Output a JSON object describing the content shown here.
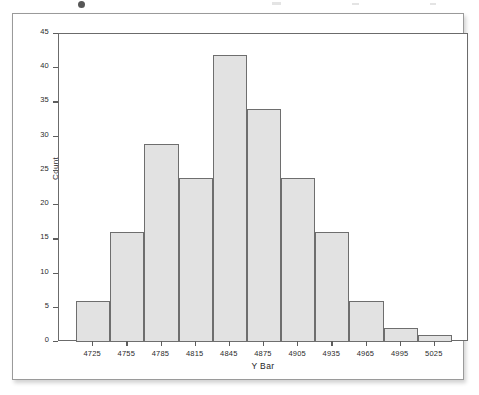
{
  "chart_data": {
    "type": "bar",
    "title": "",
    "subtitle": "",
    "xlabel": "Y Bar",
    "ylabel": "Count",
    "categories": [
      "4725",
      "4755",
      "4785",
      "4815",
      "4845",
      "4875",
      "4905",
      "4935",
      "4965",
      "4995",
      "5025"
    ],
    "values": [
      6,
      16,
      29,
      24,
      42,
      34,
      24,
      16,
      6,
      2,
      1
    ],
    "xtick_labels": [
      "4725",
      "4755",
      "4785",
      "4815",
      "4845",
      "4875",
      "4905",
      "4935",
      "4965",
      "4995",
      "5025"
    ],
    "ytick_labels": [
      "0",
      "5",
      "10",
      "15",
      "20",
      "25",
      "30",
      "35",
      "40",
      "45"
    ],
    "ytick_values": [
      0,
      5,
      10,
      15,
      20,
      25,
      30,
      35,
      40,
      45
    ],
    "ylim": [
      0,
      45
    ],
    "bin_width": 30,
    "grid": false,
    "legend": false,
    "legend_position": "none",
    "bar_fill_color": "#e2e2e2",
    "bar_border_color": "#6e6e6e",
    "axis_color": "#6b6b6b",
    "text_color": "#2b2b2b"
  },
  "figure": {
    "background_color": "#ffffff",
    "card_border_color": "#9a9a9a"
  }
}
